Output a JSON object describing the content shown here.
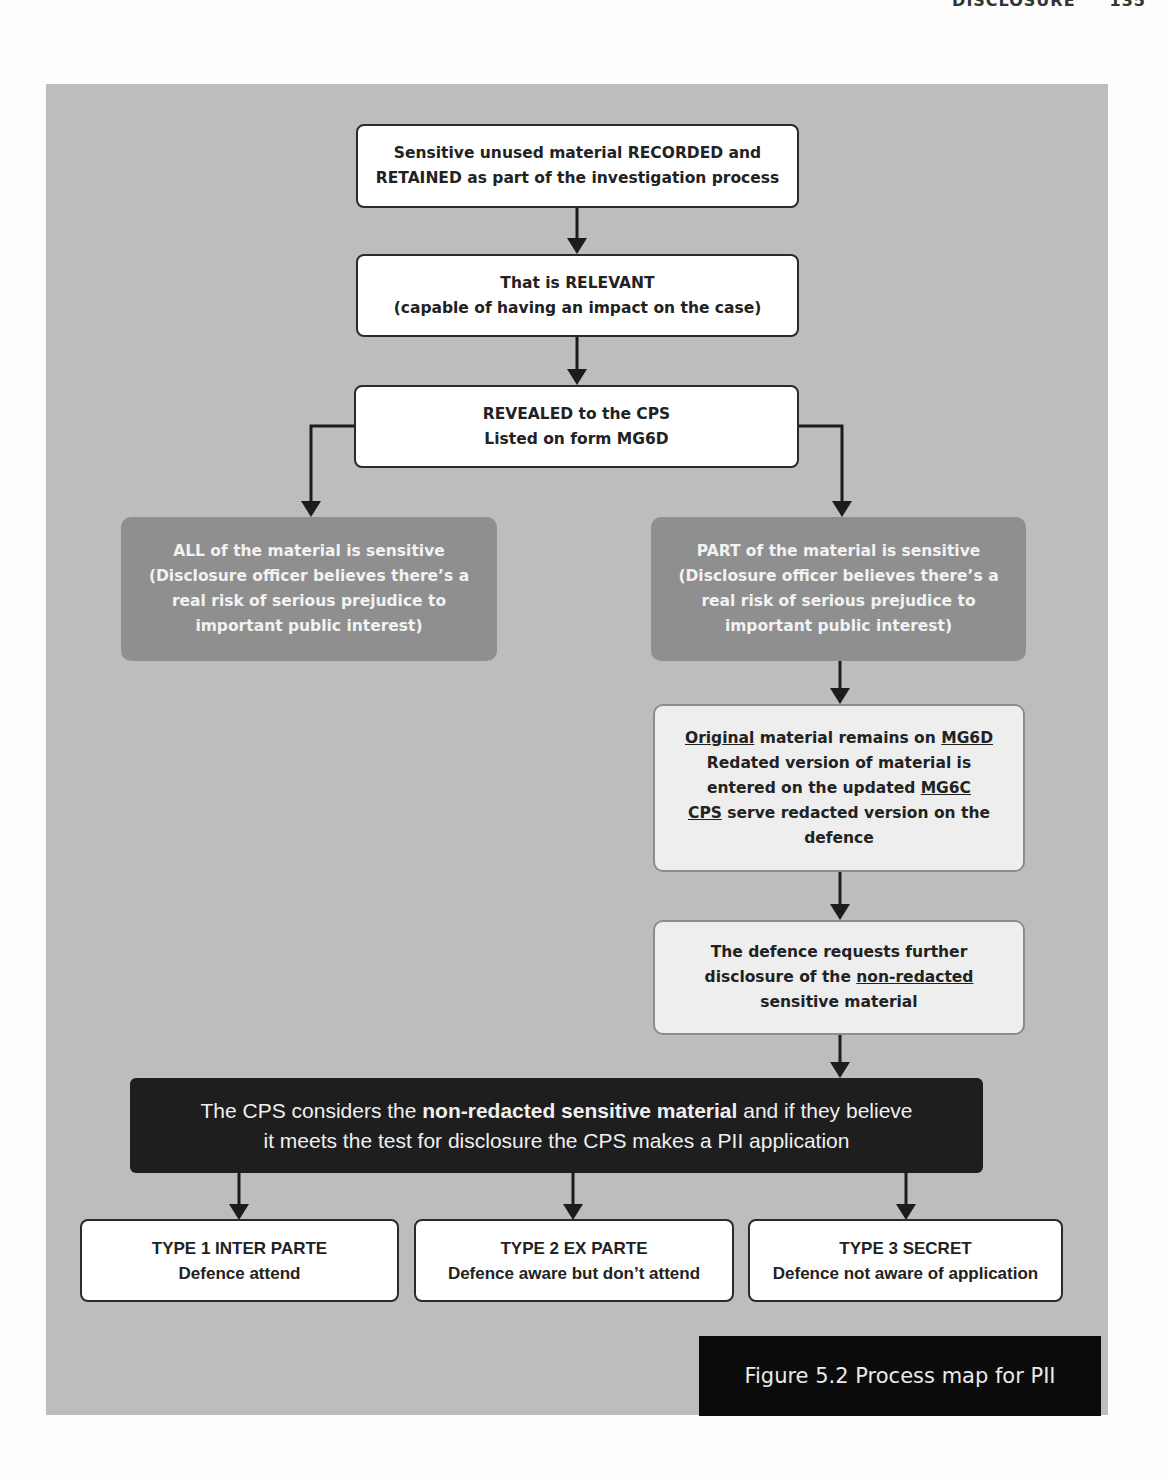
{
  "page_header": {
    "section": "DISCLOSURE",
    "page_number": "135"
  },
  "flowchart": {
    "nodes": {
      "recorded": {
        "lines": [
          "Sensitive unused material RECORDED and",
          "RETAINED as part of the investigation process"
        ]
      },
      "relevant": {
        "lines": [
          "That is RELEVANT",
          "(capable of having an impact on the case)"
        ]
      },
      "revealed": {
        "lines": [
          "REVEALED to the CPS",
          "Listed on form MG6D"
        ]
      },
      "all_sensitive": {
        "lines": [
          "ALL of the material is sensitive",
          "(Disclosure officer believes there’s a",
          "real risk of serious prejudice to",
          "important public interest)"
        ]
      },
      "part_sensitive": {
        "lines": [
          "PART of the material is sensitive",
          "(Disclosure officer believes there’s a",
          "real risk of serious prejudice to",
          "important public interest)"
        ]
      },
      "redacted": {
        "l1_u1": "Original",
        "l1_mid": " material remains on ",
        "l1_u2": "MG6D",
        "l2": "Redated version of material is",
        "l3_pre": "entered on the updated ",
        "l3_u": "MG6C",
        "l4_u": "CPS",
        "l4_post": " serve redacted version on the",
        "l5": "defence"
      },
      "defence_request": {
        "l1": "The defence requests further",
        "l2_pre": "disclosure of the ",
        "l2_u": "non-redacted",
        "l3": "sensitive material"
      },
      "cps_considers": {
        "l1_pre": "The CPS considers the ",
        "l1_bold": "non-redacted sensitive material",
        "l1_post": " and if they believe",
        "l2": "it meets the test for disclosure the CPS makes a PII application"
      },
      "type1": {
        "title": "TYPE 1 INTER PARTE",
        "desc": "Defence attend"
      },
      "type2": {
        "title": "TYPE 2 EX PARTE",
        "desc": "Defence aware but don’t attend"
      },
      "type3": {
        "title": "TYPE 3 SECRET",
        "desc": "Defence not aware of application"
      }
    },
    "edges": [
      [
        "recorded",
        "relevant"
      ],
      [
        "relevant",
        "revealed"
      ],
      [
        "revealed",
        "all_sensitive"
      ],
      [
        "revealed",
        "part_sensitive"
      ],
      [
        "part_sensitive",
        "redacted"
      ],
      [
        "redacted",
        "defence_request"
      ],
      [
        "defence_request",
        "cps_considers"
      ],
      [
        "cps_considers",
        "type1"
      ],
      [
        "cps_considers",
        "type2"
      ],
      [
        "cps_considers",
        "type3"
      ]
    ]
  },
  "caption": "Figure 5.2 Process map for PII",
  "colors": {
    "panel": "#bdbdbd",
    "grey_box": "#8f8f8f",
    "light_box": "#eeeeee",
    "dark_box": "#1e1e1e",
    "caption_bg": "#0b0b0b"
  }
}
